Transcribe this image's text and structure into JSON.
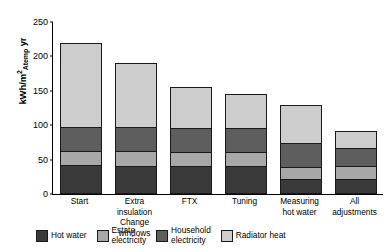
{
  "chart_data": {
    "type": "bar",
    "subtype": "stacked-bar",
    "title": "",
    "xlabel": "",
    "ylabel": "kWh/m2Atemp yr",
    "ylim": [
      0,
      250
    ],
    "yticks": [
      0,
      50,
      100,
      150,
      200,
      250
    ],
    "grid": false,
    "legend_position": "bottom",
    "categories": [
      "Start",
      "Extra insulation\nChange windows",
      "FTX",
      "Tuning",
      "Measuring\nhot water",
      "All\nadjustments"
    ],
    "series": [
      {
        "name": "Hot water",
        "color": "#3a3a3a",
        "values": [
          40,
          40,
          40,
          40,
          20,
          20
        ]
      },
      {
        "name": "Estate electricity",
        "color": "#a8a8a8",
        "values": [
          20,
          20,
          20,
          20,
          17,
          20
        ]
      },
      {
        "name": "Household electricity",
        "color": "#5e5e5e",
        "values": [
          35,
          35,
          35,
          35,
          35,
          27
        ]
      },
      {
        "name": "Radiator heat",
        "color": "#cdcdcd",
        "values": [
          125,
          95,
          60,
          50,
          58,
          25
        ]
      }
    ],
    "totals": [
      220,
      190,
      155,
      145,
      130,
      92
    ]
  },
  "ylabel_parts": {
    "prefix": "kWh/m",
    "exponent": "2",
    "subscript": "Atemp",
    "suffix": " yr"
  },
  "legend": {
    "items": [
      {
        "label": "Hot water",
        "color": "#3a3a3a"
      },
      {
        "label": "Estate\nelectricity",
        "color": "#a8a8a8"
      },
      {
        "label": "Household\nelectricity",
        "color": "#5e5e5e"
      },
      {
        "label": "Radiator heat",
        "color": "#cdcdcd"
      }
    ]
  }
}
